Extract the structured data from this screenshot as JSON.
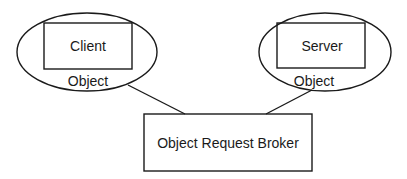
{
  "diagram": {
    "client_object": {
      "box_label": "Client",
      "ellipse_label": "Object"
    },
    "server_object": {
      "box_label": "Server",
      "ellipse_label": "Object"
    },
    "broker": {
      "label": "Object Request Broker"
    },
    "connections": [
      {
        "from": "client_object",
        "to": "broker"
      },
      {
        "from": "server_object",
        "to": "broker"
      }
    ],
    "colors": {
      "stroke": "#1a1a1a",
      "background": "#ffffff"
    }
  }
}
